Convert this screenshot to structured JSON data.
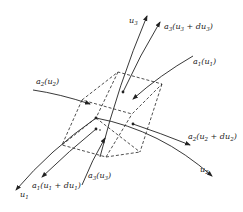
{
  "diagram": {
    "type": "curvilinear volume element",
    "labels": {
      "u1": "u1",
      "u2": "u2",
      "u3": "u3",
      "a1_u1": "a1(u1)",
      "a2_u2": "a2(u2)",
      "a3_u3_du3": "a3(u3 + du3)",
      "a2_u2_du2": "a2(u2 + du2)",
      "a1_u1_du1": "a1(u1 + du1)",
      "a3_u3": "a3(u3)"
    },
    "colors": {
      "ink": "#222222",
      "background": "#ffffff"
    }
  }
}
